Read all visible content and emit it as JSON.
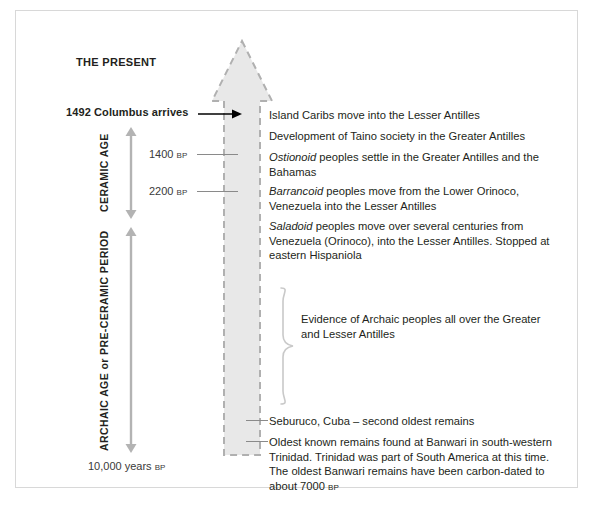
{
  "diagram": {
    "title_present": "THE PRESENT",
    "columbus": "1492 Columbus arrives",
    "bottom_scale": "10,000 years ",
    "bp_suffix": "BP",
    "eras": [
      {
        "name": "CERAMIC AGE"
      },
      {
        "name": "ARCHAIC AGE or PRE-CERAMIC PERIOD"
      }
    ],
    "ticks": [
      {
        "value": "1400 ",
        "unit": "BP"
      },
      {
        "value": "2200 ",
        "unit": "BP"
      }
    ],
    "entries": [
      {
        "id": "e1",
        "italic": "",
        "text": "Island Caribs move into the Lesser Antilles"
      },
      {
        "id": "e2",
        "italic": "",
        "text": "Development of Taino society in the Greater Antilles"
      },
      {
        "id": "e3",
        "italic": "Ostionoid",
        "text": " peoples settle in the Greater Antilles and the Bahamas"
      },
      {
        "id": "e4",
        "italic": "Barrancoid",
        "text": " peoples move from the Lower Orinoco, Venezuela into the Lesser Antilles"
      },
      {
        "id": "e5",
        "italic": "Saladoid",
        "text": " peoples move over several centuries from Venezuela (Orinoco), into the Lesser Antilles. Stopped at eastern Hispaniola"
      }
    ],
    "brace_text": "Evidence of Archaic peoples all over the Greater and Lesser Antilles",
    "seburuco": "Seburuco, Cuba – second oldest remains",
    "banwari_a": "Oldest known remains found at Banwari in south-western Trinidad. Trinidad was part of South America at this time. The oldest Banwari remains have been carbon-dated to about 7000 ",
    "banwari_bp": "BP"
  },
  "colors": {
    "arrow_fill": "#e8e8e8",
    "arrow_dash": "#b0b0b0",
    "frame_border": "#d8d8d8",
    "gray_line": "#8a8a8a",
    "vaxis": "#b3b3b3",
    "text": "#231f20"
  }
}
